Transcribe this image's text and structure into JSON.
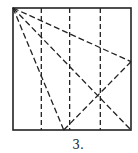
{
  "figure": {
    "caption": "3.",
    "stroke_color": "#222222",
    "background_color": "#ffffff"
  },
  "diagram": {
    "square": {
      "label": "paper-square"
    },
    "vertical_creases": [
      {
        "name": "vertical-crease-1",
        "fraction_x": 0.24
      },
      {
        "name": "vertical-crease-2",
        "fraction_x": 0.48
      },
      {
        "name": "vertical-crease-3",
        "fraction_x": 0.74
      }
    ],
    "diagonal_creases": [
      {
        "name": "diagonal-crease-to-right-edge",
        "from": [
          0,
          0
        ],
        "to": [
          1,
          0.44
        ]
      },
      {
        "name": "diagonal-crease-to-bottom-right",
        "from": [
          0,
          0
        ],
        "to": [
          1,
          1
        ]
      },
      {
        "name": "diagonal-crease-to-bottom-edge",
        "from": [
          0,
          0
        ],
        "to": [
          0.43,
          1
        ]
      },
      {
        "name": "crease-bottom-to-right-edge",
        "from": [
          0.43,
          1
        ],
        "to": [
          1,
          0.44
        ]
      }
    ]
  }
}
